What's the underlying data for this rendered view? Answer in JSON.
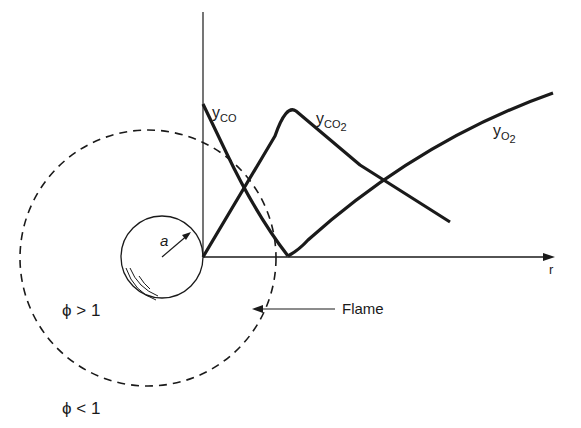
{
  "diagram": {
    "type": "droplet-flame-concentration-profile",
    "axis": {
      "horizontal_label": "r"
    },
    "droplet": {
      "radius_label": "a"
    },
    "curves": [
      {
        "id": "co",
        "label_base": "y",
        "label_sub": "CO",
        "sub2": ""
      },
      {
        "id": "co2",
        "label_base": "y",
        "label_sub": "CO",
        "sub2": "2"
      },
      {
        "id": "o2",
        "label_base": "y",
        "label_sub": "O",
        "sub2": "2"
      }
    ],
    "flame_label": "Flame",
    "regions": {
      "inner": "ϕ > 1",
      "outer": "ϕ < 1"
    },
    "colors": {
      "ink": "#1a1a1a",
      "background": "#ffffff"
    }
  }
}
